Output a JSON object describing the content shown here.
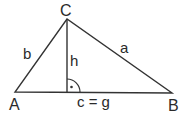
{
  "diagram": {
    "type": "triangle",
    "vertices": {
      "A": {
        "label": "A",
        "x": 15,
        "y": 92
      },
      "B": {
        "label": "B",
        "x": 172,
        "y": 93
      },
      "C": {
        "label": "C",
        "x": 67,
        "y": 19
      }
    },
    "sides": {
      "a": "a",
      "b": "b",
      "c": "c = g"
    },
    "height": {
      "label": "h",
      "foot_x": 67,
      "foot_y": 92
    },
    "right_angle_marker": true,
    "stroke_color": "#333333",
    "background": "#ffffff"
  }
}
